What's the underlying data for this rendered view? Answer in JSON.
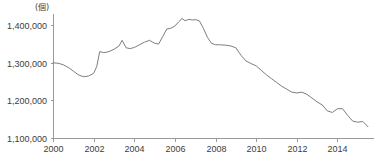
{
  "chart_data": {
    "type": "line",
    "title": "",
    "subtitle": "",
    "unit_label": "(個)",
    "xlabel": "",
    "ylabel": "",
    "xlim": [
      2000.0,
      2015.6
    ],
    "ylim": [
      1100000,
      1430000
    ],
    "ytick_labels": [
      "1,400,000",
      "1,300,000",
      "1,200,000",
      "1,100,000"
    ],
    "ytick_values": [
      1400000,
      1300000,
      1200000,
      1100000
    ],
    "xtick_labels": [
      "2000",
      "2002",
      "2004",
      "2006",
      "2008",
      "2010",
      "2012",
      "2014"
    ],
    "xtick_values": [
      2000,
      2002,
      2004,
      2006,
      2008,
      2010,
      2012,
      2014
    ],
    "grid": false,
    "legend": null,
    "legend_position": "none",
    "line_color": "#7d7d7d",
    "axis_color": "#9a9a9a",
    "series": [
      {
        "name": "series-1",
        "x": [
          2000.0,
          2000.25,
          2000.5,
          2000.75,
          2001.0,
          2001.25,
          2001.5,
          2001.75,
          2002.0,
          2002.15,
          2002.3,
          2002.5,
          2002.75,
          2003.0,
          2003.25,
          2003.4,
          2003.6,
          2003.8,
          2004.0,
          2004.25,
          2004.5,
          2004.75,
          2005.0,
          2005.2,
          2005.4,
          2005.6,
          2005.8,
          2006.0,
          2006.2,
          2006.35,
          2006.5,
          2006.7,
          2006.85,
          2007.0,
          2007.2,
          2007.4,
          2007.6,
          2007.8,
          2008.0,
          2008.25,
          2008.5,
          2008.75,
          2009.0,
          2009.25,
          2009.5,
          2009.75,
          2010.0,
          2010.25,
          2010.5,
          2010.75,
          2011.0,
          2011.25,
          2011.5,
          2011.75,
          2012.0,
          2012.25,
          2012.5,
          2012.75,
          2013.0,
          2013.25,
          2013.5,
          2013.75,
          2014.0,
          2014.25,
          2014.5,
          2014.75,
          2015.0,
          2015.25,
          2015.5
        ],
        "values": [
          1300000,
          1299000,
          1295000,
          1288000,
          1278000,
          1268000,
          1263000,
          1265000,
          1272000,
          1290000,
          1330000,
          1327000,
          1330000,
          1336000,
          1345000,
          1360000,
          1340000,
          1338000,
          1341000,
          1348000,
          1355000,
          1360000,
          1352000,
          1350000,
          1370000,
          1390000,
          1392000,
          1398000,
          1410000,
          1418000,
          1412000,
          1416000,
          1414000,
          1415000,
          1412000,
          1392000,
          1368000,
          1352000,
          1348000,
          1348000,
          1347000,
          1345000,
          1340000,
          1320000,
          1305000,
          1298000,
          1292000,
          1280000,
          1268000,
          1258000,
          1248000,
          1238000,
          1230000,
          1222000,
          1220000,
          1222000,
          1216000,
          1206000,
          1196000,
          1188000,
          1172000,
          1168000,
          1178000,
          1178000,
          1160000,
          1145000,
          1142000,
          1144000,
          1130000
        ]
      }
    ]
  },
  "geometry": {
    "plot_left": 53,
    "plot_right": 370,
    "plot_top": 14,
    "plot_bottom": 138
  }
}
